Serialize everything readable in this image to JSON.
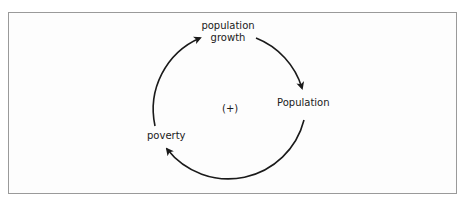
{
  "diagram": {
    "type": "causal-loop",
    "nodes": {
      "growth_line1": "population",
      "growth_line2": "growth",
      "population": "Population",
      "poverty": "poverty"
    },
    "loop_polarity": "(+)",
    "edges": [
      {
        "from": "population growth",
        "to": "Population"
      },
      {
        "from": "Population",
        "to": "poverty"
      },
      {
        "from": "poverty",
        "to": "population growth"
      }
    ],
    "colors": {
      "stroke": "#1a1a1a",
      "frame": "#9a9a9a"
    }
  }
}
